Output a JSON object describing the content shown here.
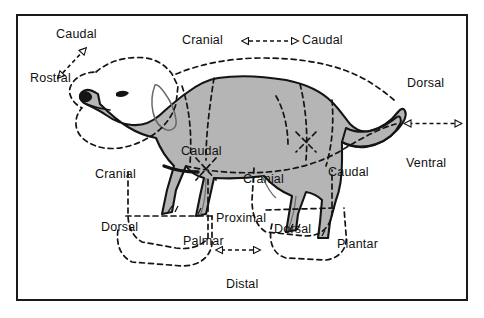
{
  "figure": {
    "view": "left lateral",
    "frame_color": "#1a1a1a",
    "body_fill": "#b5b5b5",
    "outline_color": "#141414",
    "region_boundary_style": "dashed",
    "background": "#ffffff"
  },
  "labels": {
    "head_caudal": "Caudal",
    "head_rostral": "Rostral",
    "trunk_cranial": "Cranial",
    "trunk_caudal": "Caudal",
    "body_dorsal": "Dorsal",
    "body_ventral": "Ventral",
    "forelimb_cranial": "Cranial",
    "forelimb_caudal": "Caudal",
    "forepaw_dorsal": "Dorsal",
    "forepaw_palmar": "Palmar",
    "limb_proximal": "Proximal",
    "limb_distal": "Distal",
    "hindlimb_cranial": "Cranial",
    "hindlimb_caudal": "Caudal",
    "hindpaw_dorsal": "Dorsal",
    "hindpaw_plantar": "Plantar"
  },
  "reference_arrows": [
    {
      "name": "rostral-caudal-arrow",
      "orientation": "diagonal",
      "from_label": "Rostral",
      "to_label": "Caudal",
      "applies_to": "head"
    },
    {
      "name": "cranial-caudal-arrow",
      "orientation": "horizontal",
      "from_label": "Cranial",
      "to_label": "Caudal",
      "applies_to": "trunk"
    },
    {
      "name": "dorsal-ventral-arrow",
      "orientation": "vertical",
      "from_label": "Dorsal",
      "to_label": "Ventral",
      "applies_to": "body"
    },
    {
      "name": "proximal-distal-arrow",
      "orientation": "vertical",
      "from_label": "Proximal",
      "to_label": "Distal",
      "applies_to": "limb"
    }
  ],
  "regions": [
    {
      "name": "head-region",
      "terms": [
        "Rostral",
        "Caudal"
      ]
    },
    {
      "name": "neck-trunk-region",
      "terms": [
        "Cranial",
        "Caudal",
        "Dorsal",
        "Ventral"
      ]
    },
    {
      "name": "forelimb-region",
      "terms": [
        "Cranial",
        "Caudal"
      ]
    },
    {
      "name": "forepaw-region",
      "terms": [
        "Dorsal",
        "Palmar"
      ]
    },
    {
      "name": "hindlimb-region",
      "terms": [
        "Cranial",
        "Caudal"
      ]
    },
    {
      "name": "hindpaw-region",
      "terms": [
        "Dorsal",
        "Plantar"
      ]
    },
    {
      "name": "tail-region",
      "terms": [
        "Dorsal",
        "Ventral"
      ]
    }
  ]
}
